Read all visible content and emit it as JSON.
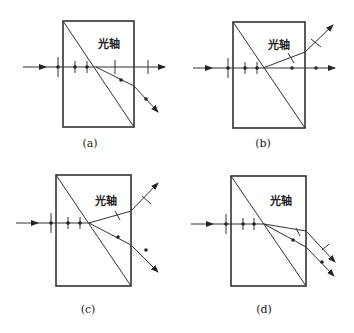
{
  "figure": {
    "panels": [
      {
        "id": "a",
        "caption": "(a)",
        "axis_label": "光轴",
        "description": "Incident ray with three perpendicular polarization marks; after diagonal interface, one ray deflected downward carrying dot (perpendicular) polarization; vertical ticks continue straight"
      },
      {
        "id": "b",
        "caption": "(b)",
        "axis_label": "光轴",
        "description": "Ray splits: dot-polarized ray continues straight; line-polarized ray deflects upward"
      },
      {
        "id": "c",
        "caption": "(c)",
        "axis_label": "光轴",
        "description": "Ray splits into upward ray with line polarization and downward ray with dot polarization"
      },
      {
        "id": "d",
        "caption": "(d)",
        "axis_label": "光轴",
        "description": "Ray splits into two downward-deflected parallel exit rays, one with line marks, one with dots"
      }
    ]
  }
}
